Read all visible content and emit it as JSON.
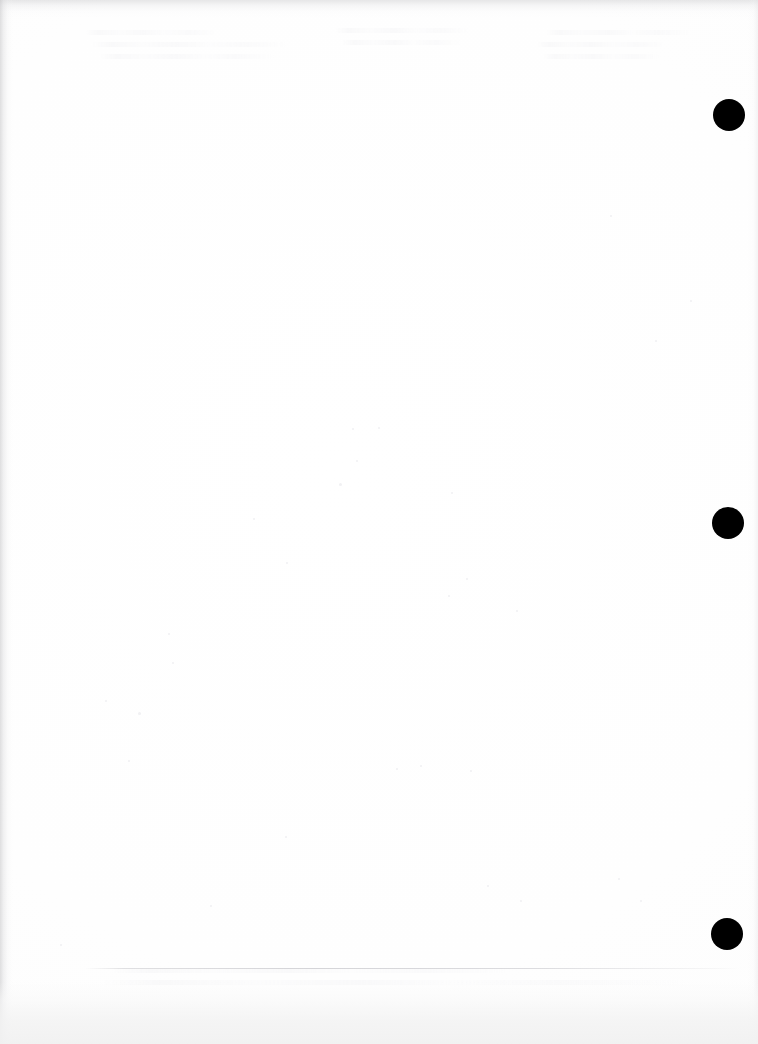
{
  "page": {
    "kind": "scanned-blank-page",
    "width": 758,
    "height": 1044,
    "background_color": "#ffffff",
    "paper_tone": "#fefefe"
  },
  "registration_marks": {
    "label": "registration-dots",
    "color": "#000000",
    "count": 3,
    "diameter": 32,
    "dots": [
      {
        "name": "registration-dot-top",
        "cx": 729,
        "cy": 115
      },
      {
        "name": "registration-dot-middle",
        "cx": 728,
        "cy": 523
      },
      {
        "name": "registration-dot-bottom",
        "cx": 727,
        "cy": 934
      }
    ]
  },
  "scan_artifacts": {
    "edge_shadow_left": {
      "name": "left-edge-shadow",
      "width": 14,
      "color": "#c4c4c6"
    },
    "edge_shadow_top": {
      "name": "top-edge-shadow",
      "height": 18,
      "color": "#cecece"
    },
    "edge_shadow_right": {
      "name": "right-edge-shadow",
      "width": 10,
      "color": "#e2e2e4"
    },
    "bottom_wash": {
      "name": "bottom-light-wash",
      "height": 62,
      "color": "#f1f1f1"
    },
    "footer_rule": {
      "name": "footer-hairline",
      "x": 85,
      "y": 968,
      "width": 655,
      "color": "#ced2d6"
    },
    "ghost_text": {
      "name": "bleed-through-ghost-text",
      "note": "illegible reverse-side show-through",
      "color": "#ebebee",
      "blocks": [
        {
          "x": 85,
          "y": 30,
          "width": 215,
          "lines": 3
        },
        {
          "x": 330,
          "y": 28,
          "width": 180,
          "lines": 2
        },
        {
          "x": 535,
          "y": 30,
          "width": 165,
          "lines": 3
        },
        {
          "x": 95,
          "y": 968,
          "width": 640,
          "lines": 2
        }
      ]
    },
    "specks": [
      {
        "x": 352,
        "y": 428,
        "size": 2
      },
      {
        "x": 378,
        "y": 427,
        "size": 2
      },
      {
        "x": 356,
        "y": 460,
        "size": 2
      },
      {
        "x": 339,
        "y": 483,
        "size": 3
      },
      {
        "x": 451,
        "y": 492,
        "size": 2
      },
      {
        "x": 253,
        "y": 518,
        "size": 2
      },
      {
        "x": 286,
        "y": 562,
        "size": 2
      },
      {
        "x": 466,
        "y": 578,
        "size": 2
      },
      {
        "x": 448,
        "y": 595,
        "size": 2
      },
      {
        "x": 516,
        "y": 610,
        "size": 2
      },
      {
        "x": 168,
        "y": 633,
        "size": 2
      },
      {
        "x": 172,
        "y": 662,
        "size": 2
      },
      {
        "x": 105,
        "y": 700,
        "size": 2
      },
      {
        "x": 138,
        "y": 712,
        "size": 3
      },
      {
        "x": 128,
        "y": 760,
        "size": 2
      },
      {
        "x": 396,
        "y": 768,
        "size": 2
      },
      {
        "x": 420,
        "y": 765,
        "size": 2
      },
      {
        "x": 470,
        "y": 770,
        "size": 2
      },
      {
        "x": 285,
        "y": 836,
        "size": 2
      },
      {
        "x": 487,
        "y": 885,
        "size": 2
      },
      {
        "x": 520,
        "y": 900,
        "size": 2
      },
      {
        "x": 618,
        "y": 878,
        "size": 2
      },
      {
        "x": 640,
        "y": 900,
        "size": 2
      },
      {
        "x": 210,
        "y": 905,
        "size": 2
      },
      {
        "x": 60,
        "y": 944,
        "size": 2
      },
      {
        "x": 690,
        "y": 300,
        "size": 2
      },
      {
        "x": 655,
        "y": 340,
        "size": 2
      },
      {
        "x": 610,
        "y": 215,
        "size": 2
      }
    ]
  }
}
